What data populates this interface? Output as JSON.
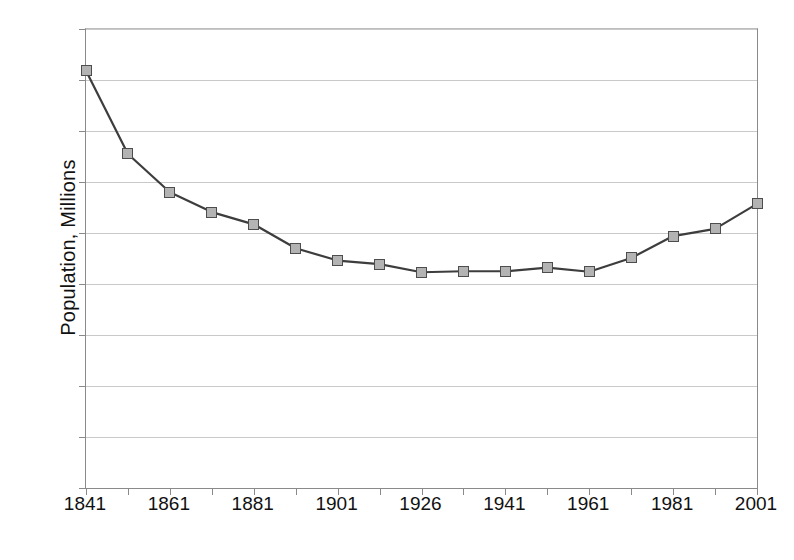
{
  "chart_data": {
    "type": "line",
    "title": "",
    "xlabel": "",
    "ylabel": "Population, Millions",
    "ylim": [
      0,
      9
    ],
    "ytick_values": [
      0,
      1,
      2,
      3,
      4,
      5,
      6,
      7,
      8,
      9
    ],
    "ytick_labels": [
      "0",
      "1",
      "2",
      "3",
      "4",
      "5",
      "6",
      "7",
      "8",
      "9"
    ],
    "grid": "horizontal",
    "legend": "none",
    "categories": [
      "1841",
      "1851",
      "1861",
      "1871",
      "1881",
      "1891",
      "1901",
      "1911",
      "1926",
      "1936",
      "1946",
      "1951",
      "1961",
      "1971",
      "1981",
      "1991",
      "2001"
    ],
    "xtick_labels_shown": [
      "1841",
      "",
      "1861",
      "",
      "1881",
      "",
      "1901",
      "",
      "1926",
      "",
      "1941",
      "",
      "1961",
      "",
      "1981",
      "",
      "2001"
    ],
    "values": [
      8.18,
      6.55,
      5.8,
      5.41,
      5.17,
      4.7,
      4.46,
      4.39,
      4.23,
      4.25,
      4.25,
      4.32,
      4.24,
      4.51,
      4.94,
      5.08,
      5.57
    ],
    "series": [
      {
        "name": "Population",
        "marker": "square",
        "marker_fill": "#b3b3b3",
        "marker_edge": "#4d4d4d",
        "line_color": "#3d3d3d",
        "values": [
          8.18,
          6.55,
          5.8,
          5.41,
          5.17,
          4.7,
          4.46,
          4.39,
          4.23,
          4.25,
          4.25,
          4.32,
          4.24,
          4.51,
          4.94,
          5.08,
          5.57
        ]
      }
    ]
  },
  "axis": {
    "y_title": "Population, Millions"
  },
  "caption": {
    "sliver_text": ""
  },
  "colors": {
    "line": "#3d3d3d",
    "marker_fill": "#b3b3b3",
    "marker_edge": "#4d4d4d",
    "grid": "#c9c9c9",
    "axis": "#8a8a8a",
    "text": "#111111",
    "background": "#ffffff"
  }
}
